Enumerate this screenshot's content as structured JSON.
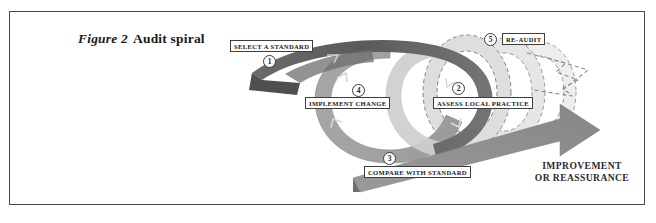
{
  "figure": {
    "number": "Figure 2",
    "title": "Audit spiral",
    "border_color": "#4a4a4a",
    "background": "#ffffff"
  },
  "diagram": {
    "type": "audit-spiral",
    "colors": {
      "band_dark": "#5d5d5d",
      "band_mid": "#9e9e9e",
      "band_light": "#d2d2d2",
      "band_faint": "#e4e4e4",
      "dashed_stroke": "#8c8c8c",
      "arrow_fill": "#8e8e8e",
      "arrow_shadow": "#6f6f6f",
      "badge_fill": "#ffffff",
      "badge_border": "#3a3a3a",
      "label_border": "#3d3d3d",
      "text": "#181818"
    },
    "steps": [
      {
        "number": "1",
        "label": "SELECT A STANDARD"
      },
      {
        "number": "2",
        "label": "ASSESS LOCAL PRACTICE"
      },
      {
        "number": "3",
        "label": "COMPARE WITH STANDARD"
      },
      {
        "number": "4",
        "label": "IMPLEMENT CHANGE"
      },
      {
        "number": "5",
        "label": "RE-AUDIT"
      }
    ],
    "outcome": {
      "line1": "IMPROVEMENT",
      "line2": "OR REASSURANCE"
    }
  }
}
